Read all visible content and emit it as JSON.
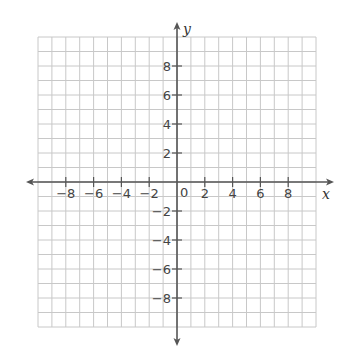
{
  "chart_data": {
    "type": "scatter",
    "title": "",
    "xlabel": "x",
    "ylabel": "y",
    "xlim": [
      -10,
      10
    ],
    "ylim": [
      -10,
      10
    ],
    "grid": true,
    "grid_step": 1,
    "x_ticks": [
      -8,
      -6,
      -4,
      -2,
      2,
      4,
      6,
      8
    ],
    "y_ticks": [
      8,
      6,
      4,
      2,
      -2,
      -4,
      -6,
      -8
    ],
    "x_tick_labels": [
      "−8",
      "−6",
      "−4",
      "−2",
      "2",
      "4",
      "6",
      "8"
    ],
    "y_tick_labels": [
      "8",
      "6",
      "4",
      "2",
      "−2",
      "−4",
      "−6",
      "−8"
    ],
    "origin_label": "0",
    "series": [],
    "legend": null
  },
  "colors": {
    "grid": "#c8c8c8",
    "axis": "#555555",
    "text": "#444444"
  }
}
